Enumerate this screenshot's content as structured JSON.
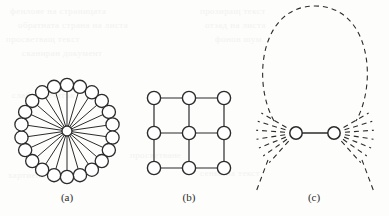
{
  "figure": {
    "type": "graph-diagram-figure",
    "background_color": "#fdfdfc",
    "stroke_color": "#2b2b2b",
    "node_fill_color": "#ffffff",
    "width": 389,
    "height": 216,
    "panels": [
      {
        "id": "a",
        "label": "(a)",
        "label_x": 67,
        "label_y": 201,
        "graph_type": "star",
        "description": "star graph: one central hub node joined by straight spokes to a ring of outer nodes",
        "center": {
          "x": 67,
          "y": 131
        },
        "hub_radius": 5.0,
        "outer_node_radius": 6.6,
        "ring_radius": 46,
        "outer_node_count": 22,
        "edge_count": 22,
        "start_angle_deg": -90,
        "edge_style": "solid",
        "line_width": 1.0
      },
      {
        "id": "b",
        "label": "(b)",
        "label_x": 189,
        "label_y": 201,
        "graph_type": "grid",
        "description": "3 by 3 square lattice graph with horizontal and vertical edges",
        "rows": 3,
        "cols": 3,
        "origin": {
          "x": 154,
          "y": 98
        },
        "spacing": 35,
        "node_radius": 6.6,
        "node_count": 9,
        "edge_count": 12,
        "edge_style": "solid",
        "line_width": 1.2
      },
      {
        "id": "c",
        "label": "(c)",
        "label_x": 314,
        "label_y": 201,
        "graph_type": "two-node-fan",
        "description": "two nodes joined by a solid edge, each with a fan of dashed half-edges, and a large dashed arc looping above",
        "node_radius": 6.2,
        "nodes": [
          {
            "name": "left-node",
            "x": 296,
            "y": 133
          },
          {
            "name": "right-node",
            "x": 334,
            "y": 133
          }
        ],
        "center_edge_style": "solid",
        "fan_ray_count_per_node": 7,
        "fan_ray_style": "dashed",
        "fan_inner_radius": 11,
        "fan_outer_radius": 40,
        "left_fan_angles_deg": [
          150,
          163,
          176,
          189,
          202,
          215,
          228
        ],
        "right_fan_angles_deg": [
          30,
          17,
          4,
          -9,
          -22,
          -35,
          -48
        ],
        "loop_arc": {
          "style": "dashed",
          "cx": 315,
          "cy": 68,
          "rx": 57,
          "ry": 62
        },
        "long_tails": [
          {
            "from": {
              "x": 268,
              "y": 160
            },
            "to": {
              "x": 256,
              "y": 192
            }
          },
          {
            "from": {
              "x": 362,
              "y": 160
            },
            "to": {
              "x": 374,
              "y": 192
            }
          }
        ],
        "dash_pattern": "5 4",
        "line_width": 1.1
      }
    ]
  },
  "page_bleed_text": [
    {
      "text": "феилове на страницата",
      "x": 10,
      "y": 6
    },
    {
      "text": "обратната страна на листа",
      "x": 18,
      "y": 20
    },
    {
      "text": "просветващ текст",
      "x": 6,
      "y": 34
    },
    {
      "text": "сканиран документ",
      "x": 22,
      "y": 48
    },
    {
      "text": "прозиращ текст",
      "x": 200,
      "y": 6
    },
    {
      "text": "отзад на листа",
      "x": 205,
      "y": 20
    },
    {
      "text": "фонов шум",
      "x": 215,
      "y": 34
    },
    {
      "text": "слаб отпечатък",
      "x": 12,
      "y": 90
    },
    {
      "text": "просветване",
      "x": 130,
      "y": 150
    },
    {
      "text": "хартиена текстура",
      "x": 8,
      "y": 170
    },
    {
      "text": "сенка на текст",
      "x": 200,
      "y": 168
    }
  ]
}
